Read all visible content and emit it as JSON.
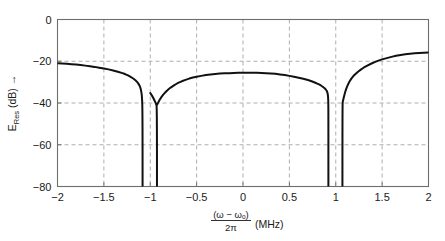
{
  "chart_data": {
    "type": "line",
    "title": "",
    "subtitle": "",
    "xlabel_parts": {
      "numerator": "(ω − ωₒ)",
      "denominator": "2π",
      "unit": "(MHz)"
    },
    "xlabel": "(ω − ωₒ)/2π (MHz)",
    "ylabel_parts": {
      "symbol": "E",
      "subscript": "Res",
      "unit": "(dB)",
      "arrow": "→"
    },
    "ylabel": "E_Res (dB) →",
    "xlim": [
      -2,
      2
    ],
    "ylim": [
      -80,
      0
    ],
    "xticks": [
      -2,
      -1.5,
      -1,
      -0.5,
      0,
      0.5,
      1,
      1.5,
      2
    ],
    "xticklabels": [
      "−2",
      "−1.5",
      "−1",
      "−0.5",
      "0",
      "0.5",
      "1",
      "1.5",
      "2"
    ],
    "yticks": [
      0,
      -20,
      -40,
      -60,
      -80
    ],
    "yticklabels": [
      "0",
      "−20",
      "−40",
      "−60",
      "−80"
    ],
    "grid": true,
    "grid_style": "dashed",
    "grid_color": "#9a9a9a",
    "axes_color": "#6e6e6e",
    "line_color": "#111111",
    "line_width": 2.0,
    "legend": null,
    "legend_position": "none",
    "annotations": [],
    "notch_frequencies": [
      -1.08,
      -0.93,
      0.92,
      1.07
    ],
    "series": [
      {
        "name": "E_Res",
        "segments": [
          {
            "name": "left-lobe",
            "points": [
              [
                -2.0,
                -21.0
              ],
              [
                -1.95,
                -21.1
              ],
              [
                -1.9,
                -21.2
              ],
              [
                -1.85,
                -21.4
              ],
              [
                -1.8,
                -21.6
              ],
              [
                -1.75,
                -21.8
              ],
              [
                -1.7,
                -22.1
              ],
              [
                -1.65,
                -22.4
              ],
              [
                -1.6,
                -22.7
              ],
              [
                -1.55,
                -23.1
              ],
              [
                -1.5,
                -23.5
              ],
              [
                -1.45,
                -23.9
              ],
              [
                -1.4,
                -24.4
              ],
              [
                -1.35,
                -25.0
              ],
              [
                -1.3,
                -25.7
              ],
              [
                -1.28,
                -26.0
              ],
              [
                -1.26,
                -26.4
              ],
              [
                -1.24,
                -26.8
              ],
              [
                -1.22,
                -27.3
              ],
              [
                -1.2,
                -27.8
              ],
              [
                -1.18,
                -28.4
              ],
              [
                -1.16,
                -29.1
              ],
              [
                -1.14,
                -30.0
              ],
              [
                -1.13,
                -30.6
              ],
              [
                -1.12,
                -31.3
              ],
              [
                -1.11,
                -32.2
              ],
              [
                -1.105,
                -32.9
              ],
              [
                -1.1,
                -33.8
              ],
              [
                -1.095,
                -35.0
              ],
              [
                -1.092,
                -36.0
              ],
              [
                -1.09,
                -37.0
              ],
              [
                -1.088,
                -38.5
              ],
              [
                -1.086,
                -40.5
              ],
              [
                -1.085,
                -43.0
              ],
              [
                -1.084,
                -47.0
              ],
              [
                -1.0835,
                -52.0
              ],
              [
                -1.083,
                -60.0
              ],
              [
                -1.0828,
                -70.0
              ],
              [
                -1.0827,
                -80.0
              ]
            ]
          },
          {
            "name": "center-lobe",
            "points": [
              [
                -0.9275,
                -80.0
              ],
              [
                -0.9276,
                -70.0
              ],
              [
                -0.9278,
                -60.0
              ],
              [
                -0.9283,
                -52.0
              ],
              [
                -0.929,
                -47.0
              ],
              [
                -0.93,
                -43.5
              ],
              [
                -0.9315,
                -41.5
              ],
              [
                -0.933,
                -41.0
              ],
              [
                -0.936,
                -40.6
              ],
              [
                -0.94,
                -40.2
              ],
              [
                -0.946,
                -39.6
              ],
              [
                -0.952,
                -39.0
              ],
              [
                -0.96,
                -38.2
              ],
              [
                -0.97,
                -37.3
              ],
              [
                -0.98,
                -36.5
              ],
              [
                -0.99,
                -35.8
              ],
              [
                -1.0,
                -35.2
              ],
              [
                -0.97,
                -37.4
              ],
              [
                -0.93,
                -41.0
              ],
              [
                -0.92,
                -40.3
              ],
              [
                -0.9,
                -38.6
              ],
              [
                -0.88,
                -37.2
              ],
              [
                -0.86,
                -36.0
              ],
              [
                -0.84,
                -35.0
              ],
              [
                -0.82,
                -34.1
              ],
              [
                -0.8,
                -33.3
              ],
              [
                -0.78,
                -32.6
              ],
              [
                -0.76,
                -32.0
              ],
              [
                -0.74,
                -31.4
              ],
              [
                -0.72,
                -30.9
              ],
              [
                -0.7,
                -30.4
              ],
              [
                -0.66,
                -29.6
              ],
              [
                -0.62,
                -28.9
              ],
              [
                -0.58,
                -28.3
              ],
              [
                -0.54,
                -27.8
              ],
              [
                -0.5,
                -27.4
              ],
              [
                -0.45,
                -27.0
              ],
              [
                -0.4,
                -26.6
              ],
              [
                -0.35,
                -26.3
              ],
              [
                -0.3,
                -26.1
              ],
              [
                -0.25,
                -25.9
              ],
              [
                -0.2,
                -25.8
              ],
              [
                -0.15,
                -25.7
              ],
              [
                -0.1,
                -25.6
              ],
              [
                -0.05,
                -25.55
              ],
              [
                0.0,
                -25.5
              ],
              [
                0.05,
                -25.5
              ],
              [
                0.1,
                -25.5
              ],
              [
                0.15,
                -25.55
              ],
              [
                0.2,
                -25.6
              ],
              [
                0.25,
                -25.7
              ],
              [
                0.3,
                -25.85
              ],
              [
                0.35,
                -26.0
              ],
              [
                0.4,
                -26.3
              ],
              [
                0.45,
                -26.6
              ],
              [
                0.5,
                -27.0
              ],
              [
                0.55,
                -27.4
              ],
              [
                0.6,
                -27.9
              ],
              [
                0.65,
                -28.4
              ],
              [
                0.7,
                -29.0
              ],
              [
                0.74,
                -29.6
              ],
              [
                0.78,
                -30.3
              ],
              [
                0.8,
                -30.7
              ],
              [
                0.82,
                -31.1
              ],
              [
                0.84,
                -31.6
              ],
              [
                0.86,
                -32.2
              ],
              [
                0.88,
                -32.9
              ],
              [
                0.89,
                -33.4
              ],
              [
                0.9,
                -34.0
              ],
              [
                0.905,
                -34.4
              ],
              [
                0.91,
                -35.0
              ],
              [
                0.913,
                -35.6
              ],
              [
                0.915,
                -36.2
              ],
              [
                0.917,
                -37.0
              ],
              [
                0.918,
                -37.8
              ],
              [
                0.919,
                -38.8
              ],
              [
                0.9195,
                -40.0
              ],
              [
                0.92,
                -41.5
              ],
              [
                0.9203,
                -44.0
              ],
              [
                0.9205,
                -48.0
              ],
              [
                0.9206,
                -55.0
              ],
              [
                0.9207,
                -65.0
              ],
              [
                0.92075,
                -80.0
              ]
            ]
          },
          {
            "name": "right-lobe",
            "points": [
              [
                1.072,
                -80.0
              ],
              [
                1.0721,
                -68.0
              ],
              [
                1.0723,
                -58.0
              ],
              [
                1.0726,
                -50.0
              ],
              [
                1.073,
                -45.0
              ],
              [
                1.0735,
                -42.0
              ],
              [
                1.074,
                -40.5
              ],
              [
                1.0745,
                -39.8
              ],
              [
                1.076,
                -39.4
              ],
              [
                1.078,
                -39.0
              ],
              [
                1.08,
                -38.6
              ],
              [
                1.084,
                -37.8
              ],
              [
                1.088,
                -37.0
              ],
              [
                1.094,
                -36.0
              ],
              [
                1.1,
                -35.0
              ],
              [
                1.11,
                -33.6
              ],
              [
                1.12,
                -32.4
              ],
              [
                1.13,
                -31.3
              ],
              [
                1.14,
                -30.4
              ],
              [
                1.15,
                -29.6
              ],
              [
                1.17,
                -28.2
              ],
              [
                1.19,
                -27.1
              ],
              [
                1.21,
                -26.2
              ],
              [
                1.24,
                -25.0
              ],
              [
                1.27,
                -24.0
              ],
              [
                1.3,
                -23.1
              ],
              [
                1.34,
                -22.1
              ],
              [
                1.38,
                -21.2
              ],
              [
                1.42,
                -20.4
              ],
              [
                1.46,
                -19.7
              ],
              [
                1.5,
                -19.1
              ],
              [
                1.55,
                -18.5
              ],
              [
                1.6,
                -17.9
              ],
              [
                1.65,
                -17.4
              ],
              [
                1.7,
                -17.0
              ],
              [
                1.75,
                -16.7
              ],
              [
                1.8,
                -16.4
              ],
              [
                1.85,
                -16.2
              ],
              [
                1.9,
                -16.0
              ],
              [
                1.95,
                -15.9
              ],
              [
                2.0,
                -15.8
              ]
            ]
          }
        ]
      }
    ]
  }
}
